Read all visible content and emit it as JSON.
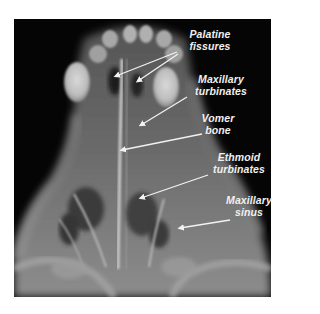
{
  "figure": {
    "type": "radiograph",
    "background_color": "#050505",
    "label_color": "#f0f0f0"
  },
  "labels": [
    {
      "id": "palatine-fissures",
      "line1": "Palatine",
      "line2": "fissures"
    },
    {
      "id": "maxillary-turbinates",
      "line1": "Maxillary",
      "line2": "turbinates"
    },
    {
      "id": "vomer-bone",
      "line1": "Vomer",
      "line2": "bone"
    },
    {
      "id": "ethmoid-turbinates",
      "line1": "Ethmoid",
      "line2": "turbinates"
    },
    {
      "id": "maxillary-sinus",
      "line1": "Maxillary",
      "line2": "sinus"
    }
  ]
}
